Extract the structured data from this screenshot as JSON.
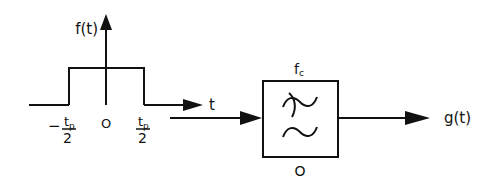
{
  "colors": {
    "ink": "#111111",
    "background": "#ffffff"
  },
  "signal_plot": {
    "y_axis_label": "f(t)",
    "x_axis_label": "t",
    "left_edge_label": {
      "sign": "−",
      "numerator": "t",
      "numerator_sub": "p",
      "denominator": "2"
    },
    "origin_label": "O",
    "right_edge_label": {
      "numerator": "t",
      "numerator_sub": "p",
      "denominator": "2"
    },
    "shape": "rectangular-pulse"
  },
  "filter_block": {
    "top_label": "f",
    "top_label_sub": "c",
    "bottom_label": "O",
    "symbol": "low-pass-filter-icon"
  },
  "output": {
    "label": "g(t)"
  }
}
